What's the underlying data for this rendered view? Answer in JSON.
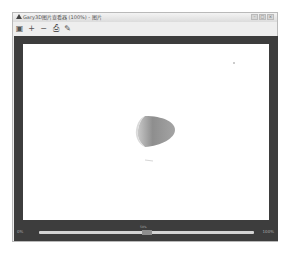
{
  "window": {
    "title": "Gary3D图片查看器 (100%) - 图片",
    "controls": [
      "minimize",
      "maximize",
      "close"
    ],
    "control_glyphs": [
      "–",
      "□",
      "×"
    ]
  },
  "toolbar": {
    "buttons": [
      {
        "name": "save",
        "icon": "save-icon",
        "glyph": "▣"
      },
      {
        "name": "zoom-in",
        "icon": "zoom-in-icon",
        "glyph": "+"
      },
      {
        "name": "zoom-out",
        "icon": "zoom-out-icon",
        "glyph": "−"
      },
      {
        "name": "print",
        "icon": "print-icon",
        "glyph": "⎙"
      },
      {
        "name": "edit",
        "icon": "pencil-icon",
        "glyph": "✎"
      }
    ]
  },
  "canvas": {
    "background": "#ffffff",
    "frame_color": "#3d3d3d",
    "shape_color": "#9a9a9a"
  },
  "statusbar": {
    "left_label": "0%",
    "center_label": "50%",
    "right_label": "100%",
    "slider_value": 50
  }
}
